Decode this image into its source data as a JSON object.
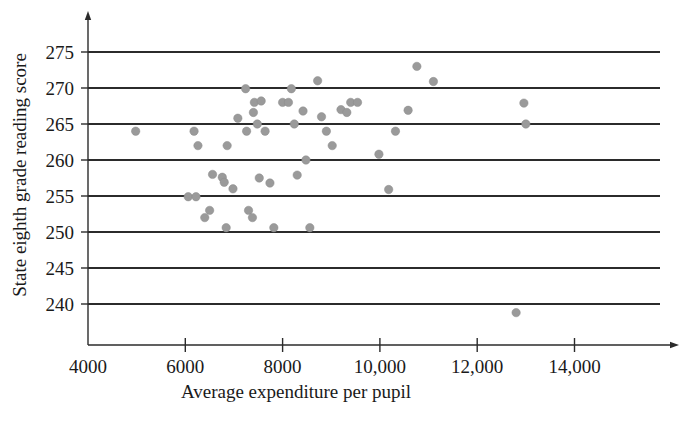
{
  "figure": {
    "background_color": "#ffffff",
    "axis_color": "#2b2b2b",
    "point_color": "#9a9a9a"
  },
  "chart_data": {
    "type": "scatter",
    "title": "",
    "xlabel": "Average expenditure per pupil",
    "ylabel": "State eighth grade reading score",
    "xlim": [
      3300,
      14900
    ],
    "ylim": [
      234,
      278
    ],
    "grid": true,
    "grid_axis": "y",
    "legend": null,
    "xticks": [
      4000,
      6000,
      8000,
      10000,
      12000,
      14000
    ],
    "xticklabels": [
      "4000",
      "6000",
      "8000",
      "10,000",
      "12,000",
      "14,000"
    ],
    "yticks": [
      240,
      245,
      250,
      255,
      260,
      265,
      270,
      275
    ],
    "yticklabels": [
      "240",
      "245",
      "250",
      "255",
      "260",
      "265",
      "270",
      "275"
    ],
    "n_points": 51,
    "points": [
      {
        "x": 4980,
        "y": 264.0
      },
      {
        "x": 6180,
        "y": 264.0
      },
      {
        "x": 6260,
        "y": 262.0
      },
      {
        "x": 6060,
        "y": 254.9
      },
      {
        "x": 6220,
        "y": 254.9
      },
      {
        "x": 6400,
        "y": 252.0
      },
      {
        "x": 6500,
        "y": 253.0
      },
      {
        "x": 6560,
        "y": 258.0
      },
      {
        "x": 6760,
        "y": 257.6
      },
      {
        "x": 6800,
        "y": 256.9
      },
      {
        "x": 6840,
        "y": 250.6
      },
      {
        "x": 6860,
        "y": 262.0
      },
      {
        "x": 6980,
        "y": 256.0
      },
      {
        "x": 7080,
        "y": 265.8
      },
      {
        "x": 7240,
        "y": 269.9
      },
      {
        "x": 7260,
        "y": 264.0
      },
      {
        "x": 7300,
        "y": 253.0
      },
      {
        "x": 7380,
        "y": 252.0
      },
      {
        "x": 7400,
        "y": 266.6
      },
      {
        "x": 7420,
        "y": 268.0
      },
      {
        "x": 7480,
        "y": 265.0
      },
      {
        "x": 7520,
        "y": 257.5
      },
      {
        "x": 7560,
        "y": 268.2
      },
      {
        "x": 7640,
        "y": 264.0
      },
      {
        "x": 7740,
        "y": 256.8
      },
      {
        "x": 7820,
        "y": 250.6
      },
      {
        "x": 8000,
        "y": 268.0
      },
      {
        "x": 8120,
        "y": 268.0
      },
      {
        "x": 8180,
        "y": 269.9
      },
      {
        "x": 8240,
        "y": 265.0
      },
      {
        "x": 8300,
        "y": 257.9
      },
      {
        "x": 8420,
        "y": 266.8
      },
      {
        "x": 8480,
        "y": 260.0
      },
      {
        "x": 8560,
        "y": 250.6
      },
      {
        "x": 8720,
        "y": 271.0
      },
      {
        "x": 8800,
        "y": 266.0
      },
      {
        "x": 8900,
        "y": 264.0
      },
      {
        "x": 9020,
        "y": 262.0
      },
      {
        "x": 9200,
        "y": 267.0
      },
      {
        "x": 9320,
        "y": 266.6
      },
      {
        "x": 9400,
        "y": 268.0
      },
      {
        "x": 9540,
        "y": 268.0
      },
      {
        "x": 9980,
        "y": 260.8
      },
      {
        "x": 10180,
        "y": 255.9
      },
      {
        "x": 10320,
        "y": 264.0
      },
      {
        "x": 10580,
        "y": 266.9
      },
      {
        "x": 10760,
        "y": 273.0
      },
      {
        "x": 11100,
        "y": 270.9
      },
      {
        "x": 12800,
        "y": 238.8
      },
      {
        "x": 12960,
        "y": 267.9
      },
      {
        "x": 13000,
        "y": 265.0
      }
    ]
  }
}
